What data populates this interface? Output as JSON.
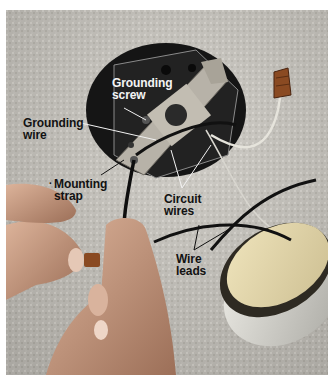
{
  "figure": {
    "colors": {
      "ceiling": "#c9c6bf",
      "box_interior": "#1a1a1a",
      "metal_strap": "#b7b2a8",
      "wire_nut": "#8a4a22",
      "skin": "#c99a80",
      "fixture_metal": "#d8d8d2",
      "fixture_insulation": "#e8dcb0",
      "label_dark": "#121212",
      "label_light": "#f4f4f4"
    },
    "callouts": {
      "grounding_screw": "Grounding\nscrew",
      "grounding_wire": "Grounding\nwire",
      "mounting_strap": "Mounting\nstrap",
      "circuit_wires": "Circuit\nwires",
      "wire_leads": "Wire\nleads"
    },
    "objects": {
      "ceiling_box": "ceiling-electrical-box",
      "mounting_strap": "metal-mounting-strap",
      "wire_nut_top": "wire-nut",
      "wire_nut_hand": "wire-nut",
      "left_hand": "hand",
      "right_hand": "hand",
      "light_fixture": "light-fixture"
    }
  }
}
